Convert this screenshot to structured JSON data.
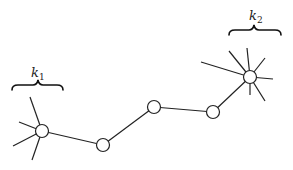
{
  "diagram": {
    "type": "graph",
    "labels": {
      "k1": {
        "base": "k",
        "sub": "1"
      },
      "k2": {
        "base": "k",
        "sub": "2"
      }
    },
    "nodes": [
      {
        "id": "n1",
        "role": "hub",
        "degree_label": "k1",
        "spokes": 4
      },
      {
        "id": "n2",
        "role": "path"
      },
      {
        "id": "n3",
        "role": "path"
      },
      {
        "id": "n4",
        "role": "path"
      },
      {
        "id": "n5",
        "role": "hub",
        "degree_label": "k2",
        "spokes": 7
      }
    ],
    "edges": [
      [
        "n1",
        "n2"
      ],
      [
        "n2",
        "n3"
      ],
      [
        "n3",
        "n4"
      ],
      [
        "n4",
        "n5"
      ]
    ],
    "colors": {
      "stroke": "#222222",
      "node_fill": "#ffffff",
      "background": "#ffffff"
    }
  }
}
